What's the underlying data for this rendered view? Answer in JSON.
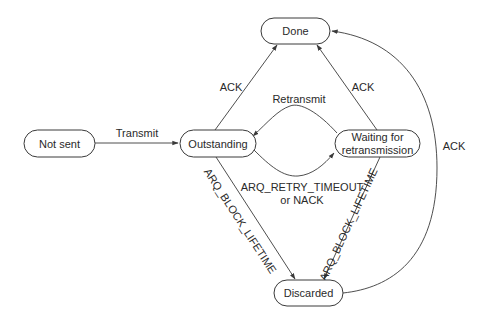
{
  "diagram": {
    "type": "state-machine",
    "colors": {
      "stroke": "#3a3a3a",
      "text": "#2a2a2a",
      "background": "#ffffff"
    },
    "nodes": {
      "not_sent": {
        "label": "Not sent"
      },
      "outstanding": {
        "label": "Outstanding"
      },
      "done": {
        "label": "Done"
      },
      "waiting": {
        "label_line1": "Waiting for",
        "label_line2": "retransmission"
      },
      "discarded": {
        "label": "Discarded"
      }
    },
    "edges": {
      "notsent_to_outstanding": {
        "from": "Not sent",
        "to": "Outstanding",
        "label": "Transmit"
      },
      "outstanding_to_done": {
        "from": "Outstanding",
        "to": "Done",
        "label": "ACK"
      },
      "waiting_to_done": {
        "from": "Waiting for retransmission",
        "to": "Done",
        "label": "ACK"
      },
      "waiting_to_outstanding": {
        "from": "Waiting for retransmission",
        "to": "Outstanding",
        "label": "Retransmit"
      },
      "outstanding_to_waiting": {
        "from": "Outstanding",
        "to": "Waiting for retransmission",
        "label_line1": "ARQ_RETRY_TIMEOUT",
        "label_line2": "or NACK"
      },
      "outstanding_to_discarded": {
        "from": "Outstanding",
        "to": "Discarded",
        "label": "ARQ_BLOCK_LIFETIME"
      },
      "waiting_to_discarded": {
        "from": "Waiting for retransmission",
        "to": "Discarded",
        "label": "ARQ_BLOCK_LIFETIME"
      },
      "discarded_to_done": {
        "from": "Discarded",
        "to": "Done",
        "label": "ACK"
      }
    }
  }
}
